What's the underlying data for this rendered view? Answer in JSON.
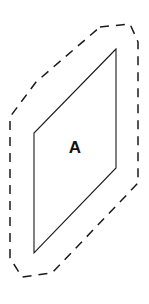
{
  "figure": {
    "type": "geometry-diagram",
    "background_color": "#ffffff",
    "stroke_color": "#1a1a1a",
    "canvas": {
      "width": 149,
      "height": 304
    }
  },
  "labels": {
    "plane_label": "A"
  },
  "shapes": {
    "plane": {
      "name": "plane-a",
      "style": "solid",
      "fill_color": "#ffffff",
      "stroke_color": "#1a1a1a",
      "stroke_width": 1.1,
      "points": "116,49 34,133 34,253 116,168"
    },
    "boundary": {
      "name": "dashed-boundary",
      "style": "dashed",
      "stroke_color": "#1a1a1a",
      "stroke_width": 1.5,
      "dash_pattern": "9 7",
      "points": "100,27 130,24 138,42 138,183 52,273 22,277 10,258 10,117 36,82 100,27"
    }
  },
  "label_position": {
    "x": 75,
    "y": 149
  }
}
